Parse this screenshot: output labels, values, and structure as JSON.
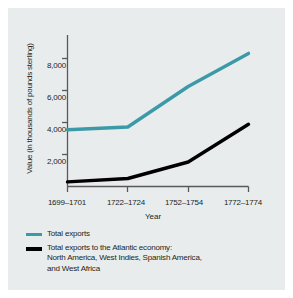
{
  "chart_data": {
    "type": "line",
    "title": "",
    "xlabel": "Year",
    "ylabel": "Value (in thousands of pounds sterling)",
    "categories": [
      "1699–1701",
      "1722–1724",
      "1752–1754",
      "1772–1774"
    ],
    "ylim": [
      0,
      9200
    ],
    "yticks": [
      2000,
      4000,
      6000,
      8000
    ],
    "ytick_labels": [
      "2,000",
      "4,000",
      "6,000",
      "8,000"
    ],
    "grid": false,
    "legend_position": "below",
    "series": [
      {
        "name": "Total exports",
        "color": "#3c9aa8",
        "values": [
          3550,
          3720,
          6250,
          8320
        ]
      },
      {
        "name": "Total exports to the Atlantic economy: North America, West Indies, Spanish America, and West Africa",
        "color": "#000000",
        "values": [
          290,
          500,
          1530,
          3890
        ]
      }
    ]
  },
  "legend": {
    "items": [
      {
        "label": "Total exports",
        "swatch": "teal-line-swatch"
      },
      {
        "label": "Total exports to the Atlantic economy:",
        "label_line2": "North America, West Indies, Spanish America,",
        "label_line3": "and West Africa",
        "swatch": "black-line-swatch"
      }
    ]
  }
}
